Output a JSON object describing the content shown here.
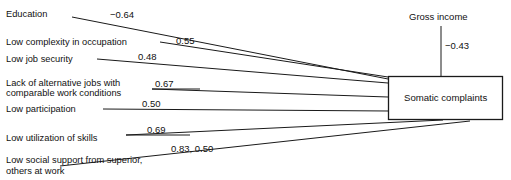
{
  "diagram": {
    "type": "path-diagram",
    "outcome_box": {
      "label": "Somatic complaints"
    },
    "external_variable": {
      "label": "Gross income",
      "coefficient": "−0.43"
    },
    "predictors": [
      {
        "id": "education",
        "label_line1": "Education",
        "label_line2": "",
        "coefficient": "−0.64"
      },
      {
        "id": "low-complexity-in-occupation",
        "label_line1": "Low complexity in occupation",
        "label_line2": "",
        "coefficient": "0.55"
      },
      {
        "id": "low-job-security",
        "label_line1": "Low job security",
        "label_line2": "",
        "coefficient": "0.48"
      },
      {
        "id": "lack-of-alternative-jobs",
        "label_line1": "Lack of alternative jobs with",
        "label_line2": "comparable work conditions",
        "coefficient": "0.67"
      },
      {
        "id": "low-participation",
        "label_line1": "Low participation",
        "label_line2": "",
        "coefficient": "0.50"
      },
      {
        "id": "low-utilization-of-skills",
        "label_line1": "Low utilization of skills",
        "label_line2": "",
        "coefficient": "0.69"
      },
      {
        "id": "low-social-support",
        "label_line1": "Low social support from superior,",
        "label_line2": "others at work",
        "coefficient": "0.83, 0.50"
      }
    ]
  }
}
